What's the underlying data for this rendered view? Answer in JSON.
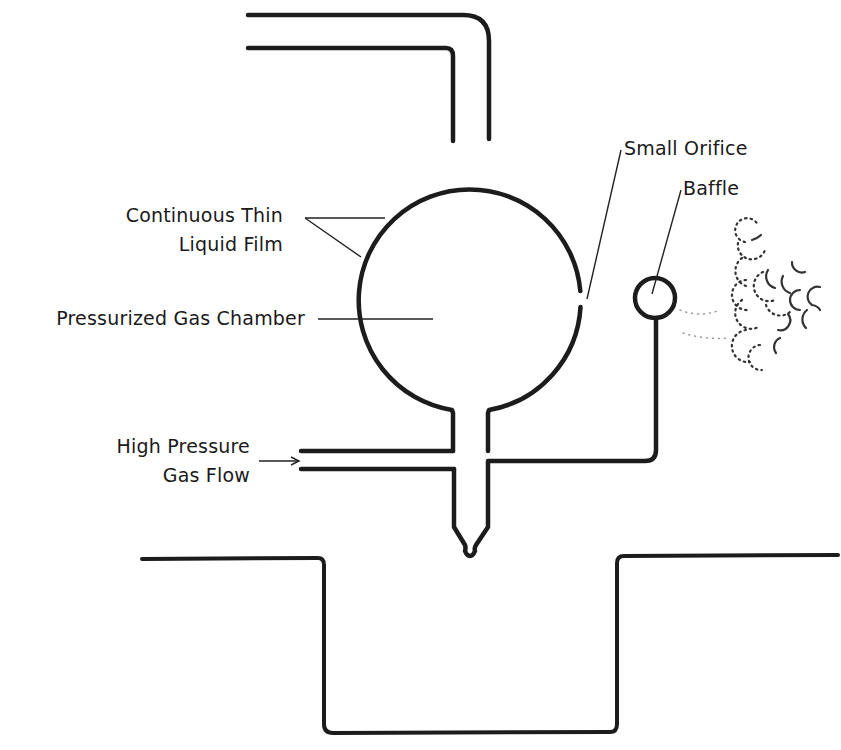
{
  "diagram": {
    "labels": {
      "film_line1": "Continuous Thin",
      "film_line2": "Liquid Film",
      "chamber": "Pressurized Gas Chamber",
      "orifice": "Small Orifice",
      "baffle": "Baffle",
      "gas_line1": "High Pressure",
      "gas_line2": "Gas Flow"
    },
    "components": [
      "top-inlet-pipe",
      "pressurized-gas-chamber",
      "small-orifice",
      "baffle",
      "high-pressure-gas-inlet",
      "nozzle",
      "liquid-trough",
      "droplet-bubbles"
    ],
    "colors": {
      "line": "#1c1c1c",
      "background": "#ffffff"
    }
  }
}
